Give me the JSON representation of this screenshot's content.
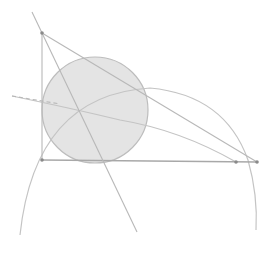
{
  "diagram": {
    "width": 274,
    "height": 253,
    "colors": {
      "line": "#b8b8b8",
      "arc": "#c4c4c4",
      "circle_fill": "#e4e4e4",
      "circle_stroke": "#bdbdbd",
      "point": "#8a8a8a",
      "base": "#a8a8a8"
    },
    "points": {
      "A": [
        42,
        33
      ],
      "B": [
        42,
        160
      ],
      "C": [
        257,
        162
      ],
      "D": [
        236,
        162
      ]
    },
    "incircle": {
      "cx": 95,
      "cy": 110,
      "r": 53
    },
    "arcs": [
      {
        "name": "arc-from-b",
        "path": "M 20 235 Q 35 95 150 88 Q 225 95 248 160 Q 258 195 256 230"
      },
      {
        "name": "arc-through-left",
        "path": "M 12 96 Q 70 108 120 120 Q 180 130 236 162"
      }
    ],
    "lines": [
      {
        "name": "side-ab",
        "x1": 42,
        "y1": 33,
        "x2": 42,
        "y2": 160
      },
      {
        "name": "side-ac",
        "x1": 42,
        "y1": 33,
        "x2": 257,
        "y2": 162
      },
      {
        "name": "side-bc",
        "x1": 42,
        "y1": 160,
        "x2": 257,
        "y2": 162
      },
      {
        "name": "extension-above-a",
        "x1": 32,
        "y1": 12,
        "x2": 42,
        "y2": 33
      },
      {
        "name": "bisector-from-a",
        "x1": 42,
        "y1": 33,
        "x2": 137,
        "y2": 232
      },
      {
        "name": "dashed-left-line",
        "x1": 12,
        "y1": 96,
        "x2": 60,
        "y2": 104
      }
    ]
  }
}
